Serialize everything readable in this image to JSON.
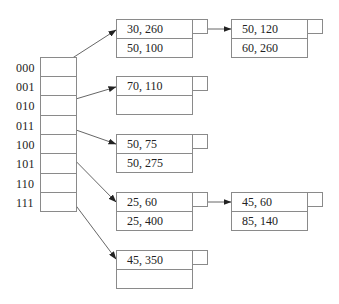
{
  "diagram": {
    "type": "extendible-hash-directory",
    "directory": {
      "labels": [
        "000",
        "001",
        "010",
        "011",
        "100",
        "101",
        "110",
        "111"
      ]
    },
    "buckets": [
      {
        "id": "b1",
        "records": [
          "30, 260",
          "50, 100"
        ]
      },
      {
        "id": "b1o",
        "records": [
          "50, 120",
          "60, 260"
        ]
      },
      {
        "id": "b2",
        "records": [
          "70, 110",
          ""
        ]
      },
      {
        "id": "b3",
        "records": [
          "50, 75",
          "50, 275"
        ]
      },
      {
        "id": "b4",
        "records": [
          "25, 60",
          "25, 400"
        ]
      },
      {
        "id": "b4o",
        "records": [
          "45, 60",
          "85, 140"
        ]
      },
      {
        "id": "b5",
        "records": [
          "45, 350",
          ""
        ]
      }
    ],
    "pointers": [
      {
        "from": "000",
        "to": "b1"
      },
      {
        "from": "010",
        "to": "b2"
      },
      {
        "from": "011",
        "to": "b3"
      },
      {
        "from": "100",
        "to": "b4"
      },
      {
        "from": "110",
        "to": "b5"
      },
      {
        "from": "b1.overflow",
        "to": "b1o"
      },
      {
        "from": "b4.overflow",
        "to": "b4o"
      }
    ],
    "colors": {
      "line": "#8a8a8a",
      "arrow": "#333333",
      "text": "#222222"
    }
  }
}
